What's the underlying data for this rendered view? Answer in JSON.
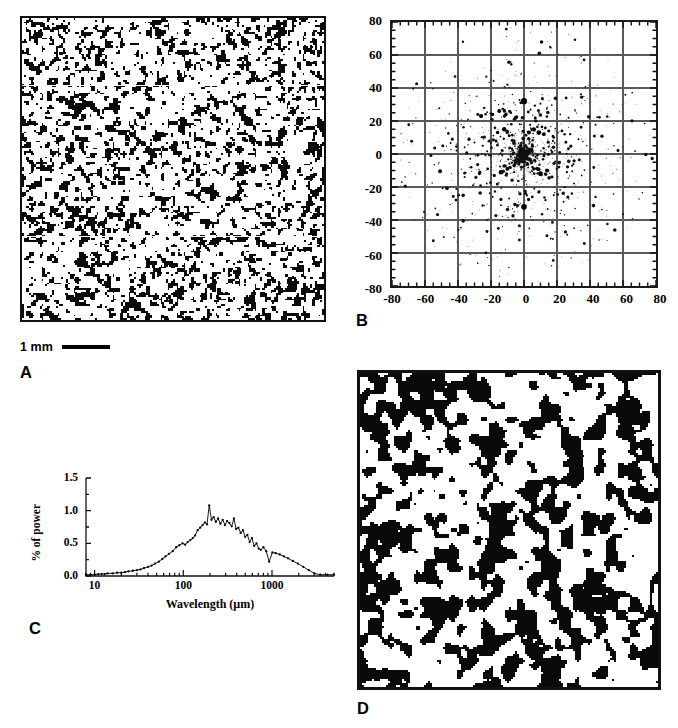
{
  "figure": {
    "panels": [
      {
        "id": "A",
        "letter": "A",
        "type": "binary-texture-image",
        "caption_scalebar": "1 mm"
      },
      {
        "id": "B",
        "letter": "B",
        "type": "scatter"
      },
      {
        "id": "C",
        "letter": "C",
        "type": "line"
      },
      {
        "id": "D",
        "letter": "D",
        "type": "binary-texture-image"
      }
    ]
  },
  "panel_a": {
    "letter": "A",
    "scalebar_label": "1 mm",
    "description": "fine-grained binary black-and-white speckle micrograph"
  },
  "panel_d": {
    "letter": "D",
    "description": "coarse-grained binary black-and-white blob micrograph"
  },
  "chart_data": [
    {
      "panel": "B",
      "type": "scatter",
      "title": "",
      "xlabel": "",
      "ylabel": "",
      "xlim": [
        -80,
        80
      ],
      "ylim": [
        -80,
        80
      ],
      "xticks": [
        -80,
        -60,
        -40,
        -20,
        0,
        20,
        40,
        60,
        80
      ],
      "yticks": [
        80,
        60,
        40,
        20,
        0,
        -20,
        -40,
        -60,
        -80
      ],
      "xticklabels": [
        "-80",
        "-60",
        "-40",
        "-20",
        "0",
        "20",
        "40",
        "60",
        "80"
      ],
      "yticklabels": [
        "80",
        "60",
        "40",
        "20",
        "0",
        "-20",
        "-40",
        "-60",
        "-80"
      ],
      "minor_ticks": true,
      "minor_tick_interval": 5,
      "grid": true,
      "grid_interval": 20,
      "legend": "none",
      "marker": "filled circle, size varies with magnitude",
      "points": [
        {
          "x": 0,
          "y": 32,
          "s": 5.0
        },
        {
          "x": -2,
          "y": 31,
          "s": 2.2
        },
        {
          "x": -15,
          "y": 26,
          "s": 3.2
        },
        {
          "x": -19,
          "y": 24,
          "s": 2.6
        },
        {
          "x": -26,
          "y": 23,
          "s": 3.4
        },
        {
          "x": -28,
          "y": 24,
          "s": 2.4
        },
        {
          "x": -24,
          "y": 28,
          "s": 1.8
        },
        {
          "x": -11,
          "y": 24,
          "s": 2.8
        },
        {
          "x": -8,
          "y": 25,
          "s": 2.0
        },
        {
          "x": -5,
          "y": 22,
          "s": 3.0
        },
        {
          "x": -1,
          "y": 22,
          "s": 2.6
        },
        {
          "x": 4,
          "y": 27,
          "s": 1.6
        },
        {
          "x": 9,
          "y": 25,
          "s": 1.4
        },
        {
          "x": 14,
          "y": 28,
          "s": 1.2
        },
        {
          "x": 22,
          "y": 24,
          "s": 1.4
        },
        {
          "x": 27,
          "y": 22,
          "s": 1.6
        },
        {
          "x": 31,
          "y": 26,
          "s": 1.2
        },
        {
          "x": -34,
          "y": 21,
          "s": 1.4
        },
        {
          "x": -7,
          "y": 36,
          "s": 1.2
        },
        {
          "x": -12,
          "y": 41,
          "s": 1.0
        },
        {
          "x": -20,
          "y": 45,
          "s": 0.9
        },
        {
          "x": 4,
          "y": 38,
          "s": 1.0
        },
        {
          "x": 11,
          "y": 36,
          "s": 0.9
        },
        {
          "x": -29,
          "y": 35,
          "s": 0.9
        },
        {
          "x": -12,
          "y": 15,
          "s": 3.6
        },
        {
          "x": -16,
          "y": 13,
          "s": 2.8
        },
        {
          "x": -9,
          "y": 11,
          "s": 2.4
        },
        {
          "x": -6,
          "y": 8,
          "s": 2.6
        },
        {
          "x": -2,
          "y": 5,
          "s": 3.0
        },
        {
          "x": -2,
          "y": 3,
          "s": 3.4
        },
        {
          "x": 3,
          "y": 13,
          "s": 3.2
        },
        {
          "x": 6,
          "y": 15,
          "s": 3.4
        },
        {
          "x": 9,
          "y": 13,
          "s": 3.8
        },
        {
          "x": 12,
          "y": 12,
          "s": 3.0
        },
        {
          "x": 15,
          "y": 14,
          "s": 2.4
        },
        {
          "x": 18,
          "y": 10,
          "s": 2.0
        },
        {
          "x": 23,
          "y": 14,
          "s": 2.2
        },
        {
          "x": 28,
          "y": 12,
          "s": 1.8
        },
        {
          "x": 33,
          "y": 9,
          "s": 1.6
        },
        {
          "x": -21,
          "y": 8,
          "s": 2.0
        },
        {
          "x": -25,
          "y": 5,
          "s": 1.8
        },
        {
          "x": -30,
          "y": 7,
          "s": 1.6
        },
        {
          "x": -36,
          "y": 4,
          "s": 1.4
        },
        {
          "x": -41,
          "y": 6,
          "s": 1.0
        },
        {
          "x": -48,
          "y": 2,
          "s": 0.8
        },
        {
          "x": 38,
          "y": 5,
          "s": 1.2
        },
        {
          "x": 44,
          "y": 0,
          "s": 1.0
        },
        {
          "x": 51,
          "y": 3,
          "s": 0.8
        },
        {
          "x": -3,
          "y": -4,
          "s": 4.2
        },
        {
          "x": -6,
          "y": -7,
          "s": 2.8
        },
        {
          "x": -10,
          "y": -9,
          "s": 3.2
        },
        {
          "x": -14,
          "y": -11,
          "s": 3.6
        },
        {
          "x": -18,
          "y": -13,
          "s": 2.6
        },
        {
          "x": -22,
          "y": -9,
          "s": 2.2
        },
        {
          "x": -27,
          "y": -12,
          "s": 2.4
        },
        {
          "x": -32,
          "y": -8,
          "s": 2.0
        },
        {
          "x": -36,
          "y": -14,
          "s": 1.6
        },
        {
          "x": 2,
          "y": -6,
          "s": 3.0
        },
        {
          "x": 6,
          "y": -9,
          "s": 2.6
        },
        {
          "x": 10,
          "y": -12,
          "s": 4.0
        },
        {
          "x": 14,
          "y": -10,
          "s": 3.4
        },
        {
          "x": 17,
          "y": -14,
          "s": 2.4
        },
        {
          "x": 21,
          "y": -8,
          "s": 2.0
        },
        {
          "x": 26,
          "y": -11,
          "s": 1.8
        },
        {
          "x": 30,
          "y": -6,
          "s": 1.6
        },
        {
          "x": 35,
          "y": -13,
          "s": 1.4
        },
        {
          "x": 0,
          "y": -32,
          "s": 4.6
        },
        {
          "x": 1,
          "y": -24,
          "s": 2.4
        },
        {
          "x": 5,
          "y": -26,
          "s": 2.2
        },
        {
          "x": 9,
          "y": -23,
          "s": 2.6
        },
        {
          "x": 13,
          "y": -28,
          "s": 1.8
        },
        {
          "x": 18,
          "y": -25,
          "s": 1.6
        },
        {
          "x": 24,
          "y": -29,
          "s": 1.6
        },
        {
          "x": 29,
          "y": -24,
          "s": 2.0
        },
        {
          "x": -9,
          "y": -27,
          "s": 1.6
        },
        {
          "x": -14,
          "y": -31,
          "s": 1.4
        },
        {
          "x": -19,
          "y": -26,
          "s": 1.4
        },
        {
          "x": -6,
          "y": -35,
          "s": 1.2
        },
        {
          "x": 4,
          "y": -38,
          "s": 1.2
        },
        {
          "x": 12,
          "y": -41,
          "s": 1.0
        },
        {
          "x": -13,
          "y": -44,
          "s": 0.9
        },
        {
          "x": -3,
          "y": -47,
          "s": 0.8
        },
        {
          "x": 22,
          "y": -36,
          "s": 1.0
        },
        {
          "x": 31,
          "y": -33,
          "s": 1.2
        },
        {
          "x": -44,
          "y": -12,
          "s": 0.9
        },
        {
          "x": -52,
          "y": -6,
          "s": 0.8
        },
        {
          "x": 41,
          "y": -17,
          "s": 1.0
        },
        {
          "x": -38,
          "y": 18,
          "s": 1.0
        },
        {
          "x": 36,
          "y": 19,
          "s": 1.1
        },
        {
          "x": -57,
          "y": 13,
          "s": 0.7
        },
        {
          "x": 58,
          "y": -2,
          "s": 0.7
        },
        {
          "x": -2,
          "y": 48,
          "s": 0.8
        },
        {
          "x": 16,
          "y": -52,
          "s": 0.7
        }
      ],
      "notes": "Power-spectrum-like point cloud, density decreasing radially from origin; largest markers at (0,32), (0,-32), (-3,-4)"
    },
    {
      "panel": "C",
      "type": "line",
      "title": "",
      "xlabel": "Wavelength (µm)",
      "ylabel": "% of power",
      "xscale": "log",
      "xlim": [
        8,
        5000
      ],
      "ylim": [
        0.0,
        1.5
      ],
      "yticks": [
        0.0,
        0.5,
        1.0,
        1.5
      ],
      "yticklabels": [
        "0.0",
        "0.5",
        "1.0",
        "1.5"
      ],
      "xticks": [
        10,
        100,
        1000
      ],
      "xticklabels": [
        "10",
        "100",
        "1000"
      ],
      "grid": false,
      "legend": "none",
      "marker": "small filled circle",
      "x": [
        8,
        9,
        10,
        11,
        12,
        13,
        14,
        16,
        18,
        20,
        22,
        24,
        27,
        30,
        33,
        36,
        40,
        44,
        48,
        53,
        58,
        63,
        69,
        76,
        83,
        90,
        98,
        105,
        112,
        120,
        128,
        136,
        145,
        155,
        165,
        175,
        185,
        196,
        208,
        220,
        233,
        247,
        262,
        278,
        295,
        312,
        331,
        351,
        372,
        394,
        418,
        443,
        470,
        498,
        528,
        560,
        594,
        630,
        668,
        708,
        750,
        800,
        860,
        930,
        1010,
        1100,
        1220,
        1360,
        1520,
        1720,
        1960,
        2250,
        2600,
        3000,
        3500,
        4200,
        5000
      ],
      "y": [
        0.02,
        0.02,
        0.02,
        0.03,
        0.03,
        0.03,
        0.04,
        0.04,
        0.05,
        0.05,
        0.06,
        0.07,
        0.08,
        0.09,
        0.1,
        0.12,
        0.14,
        0.16,
        0.19,
        0.22,
        0.26,
        0.3,
        0.34,
        0.38,
        0.44,
        0.47,
        0.5,
        0.48,
        0.52,
        0.55,
        0.58,
        0.62,
        0.7,
        0.74,
        0.78,
        0.82,
        0.79,
        1.08,
        0.86,
        0.9,
        0.83,
        0.88,
        0.8,
        0.86,
        0.78,
        0.84,
        0.81,
        0.76,
        0.88,
        0.72,
        0.74,
        0.66,
        0.7,
        0.6,
        0.63,
        0.52,
        0.58,
        0.46,
        0.5,
        0.42,
        0.4,
        0.44,
        0.38,
        0.22,
        0.36,
        0.35,
        0.33,
        0.3,
        0.27,
        0.23,
        0.19,
        0.14,
        0.09,
        0.04,
        0.02,
        0.02,
        0.02
      ],
      "notes": "Broad peak near 200 µm with max about 1.08 % of power; noisy decline beyond 300 µm; near zero below 20 µm and above 3000 µm"
    }
  ]
}
